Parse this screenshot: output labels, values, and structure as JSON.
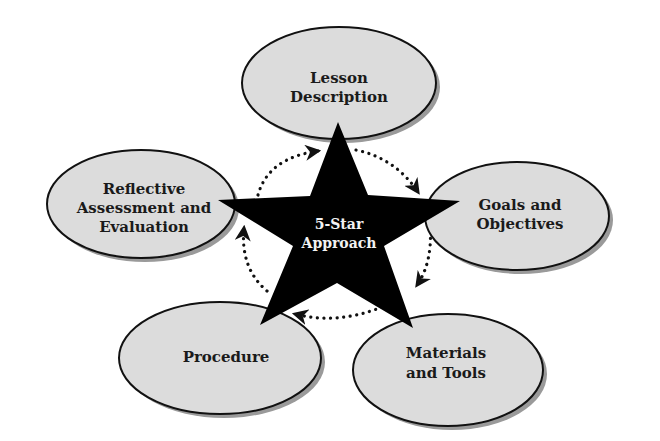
{
  "diagram": {
    "center": {
      "shape": "star",
      "lines": [
        "5-Star",
        "Approach"
      ],
      "fill": "#000000",
      "text_color": "#f2f2f2"
    },
    "nodes": [
      {
        "id": "lesson-description",
        "lines": [
          "Lesson",
          "Description"
        ]
      },
      {
        "id": "goals-and-objectives",
        "lines": [
          "Goals and",
          "Objectives"
        ]
      },
      {
        "id": "materials-and-tools",
        "lines": [
          "Materials",
          "and Tools"
        ]
      },
      {
        "id": "procedure",
        "lines": [
          "Procedure"
        ]
      },
      {
        "id": "reflective-assessment",
        "lines": [
          "Reflective",
          "Assessment and",
          "Evaluation"
        ]
      }
    ],
    "cycle": {
      "style": "dotted-arrows",
      "direction": "clockwise",
      "order": [
        "Lesson Description",
        "Goals and Objectives",
        "Materials and Tools",
        "Procedure",
        "Reflective Assessment and Evaluation"
      ]
    },
    "colors": {
      "ellipse_fill": "#dcdcdc",
      "ellipse_stroke": "#111111",
      "shadow": "#9a9a9a",
      "background": "#ffffff"
    }
  }
}
